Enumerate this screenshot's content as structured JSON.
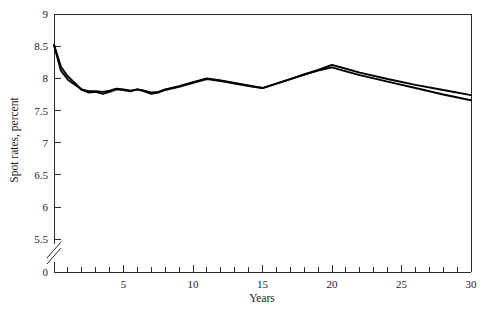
{
  "chart_data": {
    "type": "line",
    "title": "",
    "xlabel": "Years",
    "ylabel": "Spot rates, percent",
    "xlim": [
      0,
      30
    ],
    "ylim": [
      5.35,
      9
    ],
    "grid": false,
    "legend": "none",
    "axis_break": {
      "axis": "y",
      "between": [
        0,
        5.5
      ],
      "style": "double-slash"
    },
    "y_ticks": [
      5.5,
      6,
      6.5,
      7,
      7.5,
      8,
      8.5,
      9
    ],
    "y_tick_labels": [
      "5.5",
      "6",
      "6.5",
      "7",
      "7.5",
      "8",
      "8.5",
      "9"
    ],
    "y_zero_label": "0",
    "x_ticks_major": [
      0,
      5,
      10,
      15,
      20,
      25,
      30
    ],
    "x_tick_labels_major": [
      "0",
      "5",
      "10",
      "15",
      "20",
      "25",
      "30"
    ],
    "x_ticks_minor": [
      1,
      2,
      3,
      4,
      6,
      7,
      8,
      9,
      11,
      12,
      13,
      14,
      16,
      17,
      18,
      19,
      21,
      22,
      23,
      24,
      26,
      27,
      28,
      29
    ],
    "x": [
      0,
      0.5,
      1,
      1.5,
      2,
      2.5,
      3,
      3.5,
      4,
      4.5,
      5,
      5.5,
      6,
      6.5,
      7,
      7.5,
      8,
      9,
      10,
      11,
      12,
      13,
      14,
      15,
      16,
      17,
      18,
      19,
      20,
      21,
      22,
      24,
      26,
      28,
      30
    ],
    "series": [
      {
        "name": "spot-rate-curve-a",
        "color": "#000000",
        "values": [
          8.52,
          8.18,
          8.03,
          7.93,
          7.82,
          7.78,
          7.79,
          7.76,
          7.79,
          7.83,
          7.82,
          7.8,
          7.83,
          7.81,
          7.78,
          7.79,
          7.83,
          7.88,
          7.94,
          8.0,
          7.97,
          7.93,
          7.89,
          7.85,
          7.92,
          7.99,
          8.06,
          8.13,
          8.21,
          8.15,
          8.09,
          7.99,
          7.9,
          7.82,
          7.74
        ]
      },
      {
        "name": "spot-rate-curve-b",
        "color": "#000000",
        "values": [
          8.52,
          8.12,
          7.98,
          7.9,
          7.83,
          7.8,
          7.8,
          7.79,
          7.81,
          7.84,
          7.83,
          7.81,
          7.83,
          7.8,
          7.76,
          7.78,
          7.82,
          7.87,
          7.93,
          7.99,
          7.96,
          7.92,
          7.88,
          7.85,
          7.92,
          7.99,
          8.06,
          8.12,
          8.17,
          8.11,
          8.05,
          7.95,
          7.85,
          7.75,
          7.66
        ]
      }
    ]
  },
  "figure": {
    "y_axis_title": "Spot rates, percent",
    "x_axis_title": "Years"
  }
}
